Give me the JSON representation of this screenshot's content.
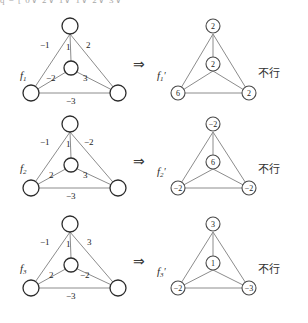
{
  "header": {
    "cropped_line": "q = [ 0∨  2∨   1∨ 1∨ 2∨ 3∨"
  },
  "symbols": {
    "implies": "⇒",
    "note_text": "不行"
  },
  "colors": {
    "node_stroke": "#2b2b2b",
    "edge_stroke": "#8c8c8c",
    "text": "#1d1d1d",
    "background": "#ffffff"
  },
  "rows": [
    {
      "left": {
        "label": "f",
        "label_sub": "1",
        "label_prime": "",
        "nodes": [
          {
            "name": "top",
            "value": ""
          },
          {
            "name": "center",
            "value": ""
          },
          {
            "name": "bottom-left",
            "value": ""
          },
          {
            "name": "bottom-right",
            "value": ""
          }
        ],
        "edges": [
          {
            "name": "top-bottomleft",
            "weight": "−1"
          },
          {
            "name": "top-center",
            "weight": "1"
          },
          {
            "name": "top-bottomright",
            "weight": "2"
          },
          {
            "name": "center-bottomleft",
            "weight": "−2"
          },
          {
            "name": "center-bottomright",
            "weight": "3"
          },
          {
            "name": "bottom-bottom",
            "weight": "−3"
          }
        ]
      },
      "right": {
        "label": "f",
        "label_sub": "1",
        "label_prime": "′",
        "nodes": [
          {
            "name": "top",
            "value": "2"
          },
          {
            "name": "center",
            "value": "2"
          },
          {
            "name": "bottom-left",
            "value": "6"
          },
          {
            "name": "bottom-right",
            "value": "2"
          }
        ]
      },
      "note": "不行"
    },
    {
      "left": {
        "label": "f",
        "label_sub": "2",
        "label_prime": "",
        "nodes": [
          {
            "name": "top",
            "value": ""
          },
          {
            "name": "center",
            "value": ""
          },
          {
            "name": "bottom-left",
            "value": ""
          },
          {
            "name": "bottom-right",
            "value": ""
          }
        ],
        "edges": [
          {
            "name": "top-bottomleft",
            "weight": "−1"
          },
          {
            "name": "top-center",
            "weight": "1"
          },
          {
            "name": "top-bottomright",
            "weight": "−2"
          },
          {
            "name": "center-bottomleft",
            "weight": "2"
          },
          {
            "name": "center-bottomright",
            "weight": "3"
          },
          {
            "name": "bottom-bottom",
            "weight": "−3"
          }
        ]
      },
      "right": {
        "label": "f",
        "label_sub": "2",
        "label_prime": "′",
        "nodes": [
          {
            "name": "top",
            "value": "−2"
          },
          {
            "name": "center",
            "value": "6"
          },
          {
            "name": "bottom-left",
            "value": "−2"
          },
          {
            "name": "bottom-right",
            "value": "−2"
          }
        ]
      },
      "note": "不行"
    },
    {
      "left": {
        "label": "f",
        "label_sub": "3",
        "label_prime": "",
        "nodes": [
          {
            "name": "top",
            "value": ""
          },
          {
            "name": "center",
            "value": ""
          },
          {
            "name": "bottom-left",
            "value": ""
          },
          {
            "name": "bottom-right",
            "value": ""
          }
        ],
        "edges": [
          {
            "name": "top-bottomleft",
            "weight": "−1"
          },
          {
            "name": "top-center",
            "weight": "1"
          },
          {
            "name": "top-bottomright",
            "weight": "3"
          },
          {
            "name": "center-bottomleft",
            "weight": "2"
          },
          {
            "name": "center-bottomright",
            "weight": "−2"
          },
          {
            "name": "bottom-bottom",
            "weight": "−3"
          }
        ]
      },
      "right": {
        "label": "f",
        "label_sub": "3",
        "label_prime": "′",
        "nodes": [
          {
            "name": "top",
            "value": "3"
          },
          {
            "name": "center",
            "value": "1"
          },
          {
            "name": "bottom-left",
            "value": "−2"
          },
          {
            "name": "bottom-right",
            "value": "−3"
          }
        ]
      },
      "note": "不行"
    }
  ]
}
